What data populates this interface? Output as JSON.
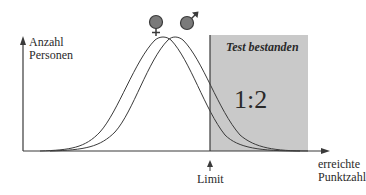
{
  "diagram": {
    "y_axis_label_line1": "Anzahl",
    "y_axis_label_line2": "Personen",
    "x_axis_label_line1": "erreichte",
    "x_axis_label_line2": "Punktzahl",
    "limit_label": "Limit",
    "pass_region_title": "Test bestanden",
    "pass_ratio": "1:2",
    "series": [
      {
        "name": "female",
        "symbol": "♀",
        "peak_x": 163
      },
      {
        "name": "male",
        "symbol": "♂",
        "peak_x": 175
      }
    ],
    "colors": {
      "pass_region": "#c9c9c9",
      "curve": "#3a3a3a",
      "symbol_fill": "#7a7a7a"
    }
  }
}
